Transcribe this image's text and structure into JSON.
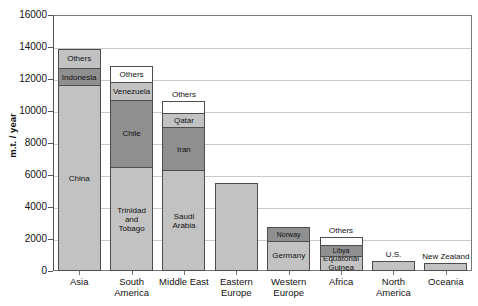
{
  "chart_data": {
    "type": "bar",
    "stacked": true,
    "title": "",
    "xlabel": "",
    "ylabel": "m.t. / year",
    "ylim": [
      0,
      16000
    ],
    "ytick_step": 2000,
    "ytick_labels": [
      "0",
      "2000",
      "4000",
      "6000",
      "8000",
      "10000",
      "12000",
      "14000",
      "16000"
    ],
    "grid": true,
    "legend": false,
    "categories": [
      "Asia",
      "South America",
      "Middle East",
      "Eastern Europe",
      "Western Europe",
      "Africa",
      "North America",
      "Oceania"
    ],
    "totals": [
      13900,
      12800,
      10600,
      5500,
      2750,
      2100,
      600,
      500
    ],
    "bars": [
      {
        "category": "Asia",
        "total": 13900,
        "segments": [
          {
            "label": "China",
            "value": 11600,
            "shade": "light",
            "label_position": "inside"
          },
          {
            "label": "Indonesia",
            "value": 1100,
            "shade": "dark",
            "label_position": "inside"
          },
          {
            "label": "Others",
            "value": 1200,
            "shade": "light",
            "label_position": "inside"
          }
        ]
      },
      {
        "category": "South America",
        "total": 12800,
        "segments": [
          {
            "label": "Trinidad and Tobago",
            "value": 6500,
            "shade": "light",
            "label_position": "inside"
          },
          {
            "label": "Chile",
            "value": 4200,
            "shade": "dark",
            "label_position": "inside"
          },
          {
            "label": "Venezuela",
            "value": 1100,
            "shade": "light",
            "label_position": "inside"
          },
          {
            "label": "Others",
            "value": 1000,
            "shade": "white",
            "label_position": "inside"
          }
        ]
      },
      {
        "category": "Middle East",
        "total": 10600,
        "segments": [
          {
            "label": "Saudi Arabia",
            "value": 6300,
            "shade": "light",
            "label_position": "inside"
          },
          {
            "label": "Iran",
            "value": 2700,
            "shade": "dark",
            "label_position": "inside"
          },
          {
            "label": "Qatar",
            "value": 900,
            "shade": "light",
            "label_position": "inside"
          },
          {
            "label": "Others",
            "value": 700,
            "shade": "white",
            "label_position": "above"
          }
        ]
      },
      {
        "category": "Eastern Europe",
        "total": 5500,
        "segments": [
          {
            "label": "",
            "value": 5500,
            "shade": "light",
            "label_position": "none"
          }
        ]
      },
      {
        "category": "Western Europe",
        "total": 2750,
        "segments": [
          {
            "label": "Germany",
            "value": 1900,
            "shade": "light",
            "label_position": "inside"
          },
          {
            "label": "Norway",
            "value": 850,
            "shade": "dark",
            "label_position": "inside"
          }
        ]
      },
      {
        "category": "Africa",
        "total": 2100,
        "segments": [
          {
            "label": "Equatorial Guinea",
            "value": 950,
            "shade": "light",
            "label_position": "inside"
          },
          {
            "label": "Libya",
            "value": 700,
            "shade": "dark",
            "label_position": "inside"
          },
          {
            "label": "Others",
            "value": 450,
            "shade": "white",
            "label_position": "above"
          }
        ]
      },
      {
        "category": "North America",
        "total": 600,
        "segments": [
          {
            "label": "U.S.",
            "value": 600,
            "shade": "light",
            "label_position": "above"
          }
        ]
      },
      {
        "category": "Oceania",
        "total": 500,
        "segments": [
          {
            "label": "New Zealand",
            "value": 500,
            "shade": "light",
            "label_position": "above"
          }
        ]
      }
    ]
  }
}
